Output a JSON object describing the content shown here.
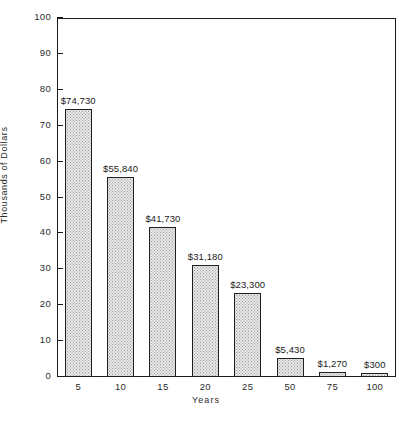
{
  "chart_data": {
    "type": "bar",
    "title": "",
    "xlabel": "Years",
    "ylabel": "Thousands of Dollars",
    "categories": [
      "5",
      "10",
      "15",
      "20",
      "25",
      "50",
      "75",
      "100"
    ],
    "values": [
      74.73,
      55.84,
      41.73,
      31.18,
      23.3,
      5.43,
      1.27,
      0.3
    ],
    "value_labels": [
      "$74,730",
      "$55,840",
      "$41,730",
      "$31,180",
      "$23,300",
      "$5,430",
      "$1,270",
      "$300"
    ],
    "ylim": [
      0,
      100
    ],
    "ytick_labels": [
      "0",
      "10",
      "20",
      "30",
      "40",
      "50",
      "60",
      "70",
      "80",
      "90",
      "100"
    ],
    "ytick_values": [
      0,
      10,
      20,
      30,
      40,
      50,
      60,
      70,
      80,
      90,
      100
    ],
    "grid": false,
    "legend": null,
    "bar_fill_color": "#e9e9e9",
    "bar_edge_color": "#1f1f1f",
    "axis_color": "#1a1a1a",
    "background_color": "#ffffff"
  }
}
